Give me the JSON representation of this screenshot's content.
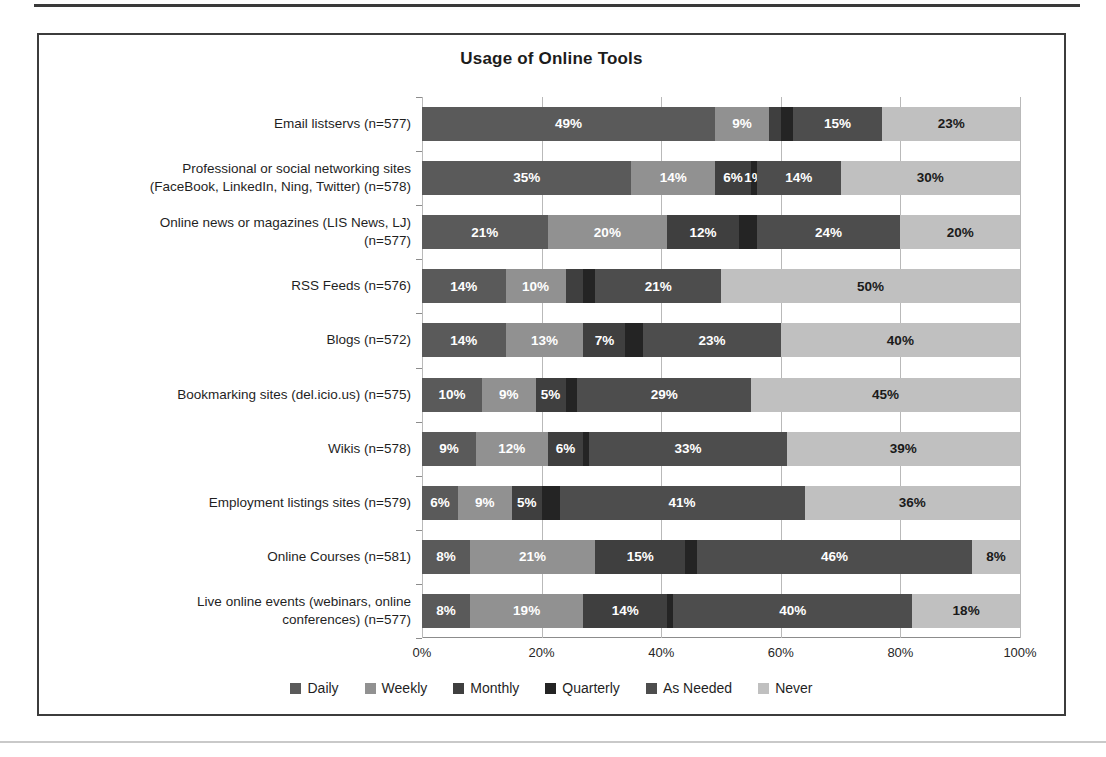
{
  "frame": {
    "border_color": "#3c3c3c",
    "background": "#ffffff"
  },
  "chart_data": {
    "type": "bar",
    "orientation": "horizontal",
    "stacked": true,
    "stack_mode": "percent",
    "title": "Usage of Online Tools",
    "xlabel": "",
    "ylabel": "",
    "xlim": [
      0,
      100
    ],
    "xticks": [
      "0%",
      "20%",
      "40%",
      "60%",
      "80%",
      "100%"
    ],
    "xtick_values": [
      0,
      20,
      40,
      60,
      80,
      100
    ],
    "grid": true,
    "legend_position": "bottom",
    "categories": [
      "Email listservs (n=577)",
      "Professional or social networking sites (FaceBook, LinkedIn, Ning, Twitter) (n=578)",
      "Online news or magazines (LIS News, LJ) (n=577)",
      "RSS Feeds (n=576)",
      "Blogs (n=572)",
      "Bookmarking sites (del.icio.us) (n=575)",
      "Wikis (n=578)",
      "Employment listings sites (n=579)",
      "Online Courses (n=581)",
      "Live online events (webinars, online conferences) (n=577)"
    ],
    "category_lines": [
      [
        "Email listservs (n=577)"
      ],
      [
        "Professional or social networking sites",
        "(FaceBook, LinkedIn, Ning, Twitter) (n=578)"
      ],
      [
        "Online news or magazines (LIS News, LJ)",
        "(n=577)"
      ],
      [
        "RSS Feeds (n=576)"
      ],
      [
        "Blogs (n=572)"
      ],
      [
        "Bookmarking sites (del.icio.us) (n=575)"
      ],
      [
        "Wikis (n=578)"
      ],
      [
        "Employment listings sites (n=579)"
      ],
      [
        "Online Courses (n=581)"
      ],
      [
        "Live online events (webinars, online",
        "conferences) (n=577)"
      ]
    ],
    "series": [
      {
        "name": "Daily",
        "color": "#5a5a5a",
        "label_color": "light",
        "values": [
          49,
          35,
          21,
          14,
          14,
          10,
          9,
          6,
          8,
          8
        ],
        "labels": [
          "49%",
          "35%",
          "21%",
          "14%",
          "14%",
          "10%",
          "9%",
          "6%",
          "8%",
          "8%"
        ]
      },
      {
        "name": "Weekly",
        "color": "#919191",
        "label_color": "light",
        "values": [
          9,
          14,
          20,
          10,
          13,
          9,
          12,
          9,
          21,
          19
        ],
        "labels": [
          "9%",
          "14%",
          "20%",
          "10%",
          "13%",
          "9%",
          "12%",
          "9%",
          "21%",
          "19%"
        ]
      },
      {
        "name": "Monthly",
        "color": "#3f3f3f",
        "label_color": "light",
        "values": [
          2,
          6,
          12,
          3,
          7,
          5,
          6,
          5,
          15,
          14
        ],
        "labels": [
          "",
          "6%",
          "12%",
          "",
          "7%",
          "5%",
          "6%",
          "5%",
          "15%",
          "14%"
        ]
      },
      {
        "name": "Quarterly",
        "color": "#242424",
        "label_color": "light",
        "values": [
          2,
          1,
          3,
          2,
          3,
          2,
          1,
          3,
          2,
          1
        ],
        "labels": [
          "",
          "1%",
          "",
          "",
          "",
          "",
          "",
          "",
          "",
          ""
        ]
      },
      {
        "name": "As Needed",
        "color": "#4d4d4d",
        "label_color": "light",
        "values": [
          15,
          14,
          24,
          21,
          23,
          29,
          33,
          41,
          46,
          40
        ],
        "labels": [
          "15%",
          "14%",
          "24%",
          "21%",
          "23%",
          "29%",
          "33%",
          "41%",
          "46%",
          "40%"
        ]
      },
      {
        "name": "Never",
        "color": "#c0c0c0",
        "label_color": "dark",
        "values": [
          23,
          30,
          20,
          50,
          40,
          45,
          39,
          36,
          8,
          18
        ],
        "labels": [
          "23%",
          "30%",
          "20%",
          "50%",
          "40%",
          "45%",
          "39%",
          "36%",
          "8%",
          "18%"
        ]
      }
    ]
  }
}
